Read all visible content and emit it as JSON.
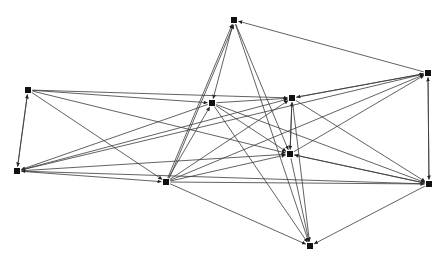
{
  "diagram": {
    "type": "directed-network-graph",
    "node_shape": "square",
    "node_size": 6,
    "colors": {
      "background": "#ffffff",
      "edge": "#3a3a3a",
      "node": "#111111"
    },
    "nodes": [
      {
        "id": "A",
        "x": 234,
        "y": 20
      },
      {
        "id": "B",
        "x": 428,
        "y": 73
      },
      {
        "id": "C",
        "x": 28,
        "y": 90
      },
      {
        "id": "D",
        "x": 212,
        "y": 103
      },
      {
        "id": "E",
        "x": 292,
        "y": 98
      },
      {
        "id": "F",
        "x": 17,
        "y": 171
      },
      {
        "id": "G",
        "x": 166,
        "y": 182
      },
      {
        "id": "H",
        "x": 290,
        "y": 154
      },
      {
        "id": "I",
        "x": 429,
        "y": 184
      },
      {
        "id": "J",
        "x": 310,
        "y": 246
      }
    ],
    "edges": [
      [
        "B",
        "A"
      ],
      [
        "A",
        "D"
      ],
      [
        "A",
        "H"
      ],
      [
        "G",
        "A"
      ],
      [
        "G",
        "A"
      ],
      [
        "A",
        "J"
      ],
      [
        "B",
        "E"
      ],
      [
        "E",
        "B"
      ],
      [
        "B",
        "I"
      ],
      [
        "I",
        "B"
      ],
      [
        "G",
        "B"
      ],
      [
        "F",
        "B"
      ],
      [
        "H",
        "B"
      ],
      [
        "C",
        "F"
      ],
      [
        "F",
        "C"
      ],
      [
        "C",
        "E"
      ],
      [
        "C",
        "H"
      ],
      [
        "C",
        "G"
      ],
      [
        "C",
        "D"
      ],
      [
        "D",
        "E"
      ],
      [
        "D",
        "I"
      ],
      [
        "D",
        "H"
      ],
      [
        "D",
        "J"
      ],
      [
        "D",
        "F"
      ],
      [
        "G",
        "D"
      ],
      [
        "E",
        "H"
      ],
      [
        "H",
        "E"
      ],
      [
        "E",
        "J"
      ],
      [
        "E",
        "I"
      ],
      [
        "G",
        "E"
      ],
      [
        "F",
        "E"
      ],
      [
        "H",
        "I"
      ],
      [
        "I",
        "H"
      ],
      [
        "H",
        "J"
      ],
      [
        "G",
        "H"
      ],
      [
        "F",
        "H"
      ],
      [
        "G",
        "I"
      ],
      [
        "G",
        "J"
      ],
      [
        "I",
        "J"
      ],
      [
        "F",
        "G"
      ],
      [
        "I",
        "F"
      ]
    ]
  }
}
